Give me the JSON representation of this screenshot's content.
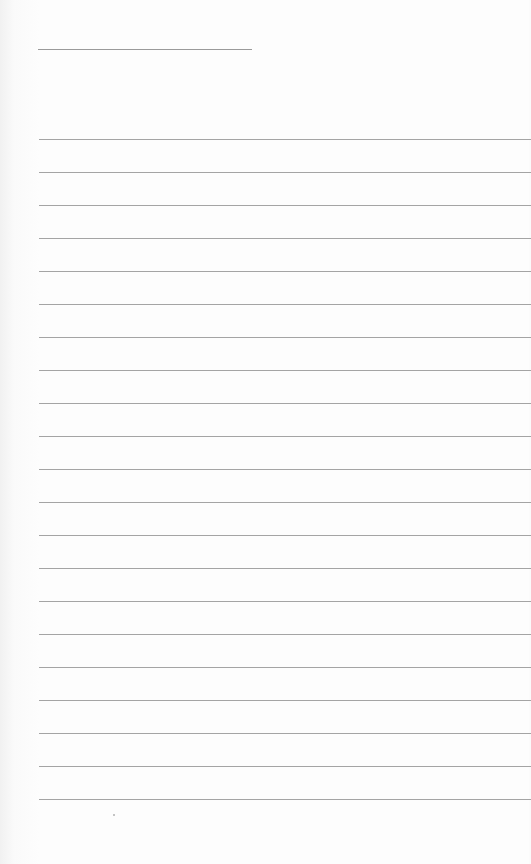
{
  "page": {
    "type": "lined-paper",
    "background_color": "#fdfdfd",
    "rule_color": "#a4a4a4",
    "title_line": {
      "x": 38,
      "y": 49,
      "width": 214
    },
    "rules": {
      "count": 21,
      "first_y": 139,
      "spacing": 33,
      "x": 39
    },
    "text": "",
    "mark": {
      "x": 113,
      "y": 814
    }
  }
}
